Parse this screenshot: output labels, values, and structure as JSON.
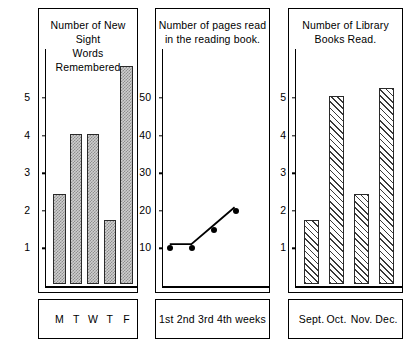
{
  "page": {
    "background": "#ffffff",
    "ink": "#000000"
  },
  "chart_data": [
    {
      "type": "bar",
      "panel_id": "sight-words",
      "title": "Number of New Sight\nWords Remembered",
      "title_lines": [
        "Number of New Sight",
        "Words Remembered"
      ],
      "categories": [
        "M",
        "T",
        "W",
        "T",
        "F"
      ],
      "values": [
        2.4,
        4.0,
        4.0,
        1.7,
        5.8
      ],
      "xlabel": "",
      "ylabel": "",
      "ylim": [
        0,
        6.3
      ],
      "yticks": [
        1,
        2,
        3,
        4,
        5
      ],
      "ytick_labels": [
        "1",
        "2",
        "3",
        "4",
        "5"
      ],
      "grid": false,
      "legend": "none",
      "bar_fill": "dotted-gray",
      "bar_fill_color": "#cfcfcf",
      "bar_edge_color": "#2a2a2a"
    },
    {
      "type": "line",
      "panel_id": "pages-read",
      "title": "Number of pages read\nin the reading book.",
      "title_lines": [
        "Number of pages read",
        "in the reading book."
      ],
      "categories": [
        "1st",
        "2nd",
        "3rd",
        "4th"
      ],
      "footer_label": "1st 2nd 3rd 4th weeks",
      "x": [
        1,
        2,
        3,
        4
      ],
      "values": [
        10,
        10,
        15,
        20
      ],
      "xlabel": "weeks",
      "ylabel": "",
      "ylim": [
        0,
        63
      ],
      "yticks": [
        10,
        20,
        30,
        40,
        50
      ],
      "ytick_labels": [
        "10",
        "20",
        "30",
        "40",
        "50"
      ],
      "grid": false,
      "legend": "none",
      "marker": "filled-circle",
      "line_color": "#000000"
    },
    {
      "type": "bar",
      "panel_id": "library-books",
      "title": "Number of Library\nBooks Read.",
      "title_lines": [
        "Number of  Library",
        "Books Read."
      ],
      "categories": [
        "Sept.",
        "Oct.",
        "Nov.",
        "Dec."
      ],
      "values": [
        1.7,
        5.0,
        2.4,
        5.2
      ],
      "xlabel": "",
      "ylabel": "",
      "ylim": [
        0,
        6.3
      ],
      "yticks": [
        1,
        2,
        3,
        4,
        5
      ],
      "ytick_labels": [
        "1",
        "2",
        "3",
        "4",
        "5"
      ],
      "grid": false,
      "legend": "none",
      "bar_fill": "diagonal-hatch",
      "bar_fill_color": "#ffffff",
      "bar_edge_color": "#3a3a3a"
    }
  ]
}
